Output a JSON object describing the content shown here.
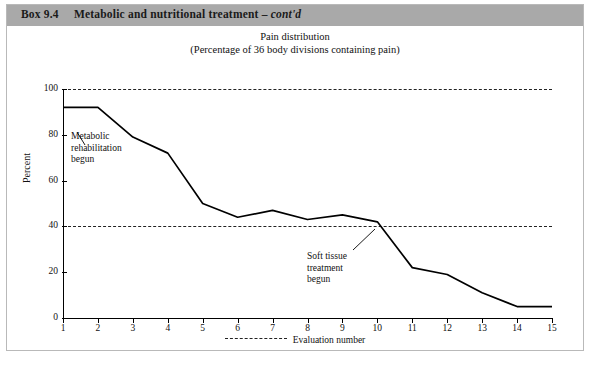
{
  "box": {
    "label": "Box 9.4",
    "title_plain": "Metabolic and nutritional treatment – ",
    "title_italic": "cont'd"
  },
  "annotations": [
    {
      "name": "metabolic-rehabilitation-annotation",
      "text": "Metabolic\nrehabilitation\nbegun"
    },
    {
      "name": "soft-tissue-treatment-annotation",
      "text": "Soft tissue\ntreatment\nbegun"
    }
  ],
  "chart_data": {
    "type": "line",
    "title": "Pain distribution",
    "subtitle": "(Percentage of 36 body divisions containing pain)",
    "xlabel": "Evaluation number",
    "ylabel": "Percent",
    "x": [
      1,
      2,
      3,
      4,
      5,
      6,
      7,
      8,
      9,
      10,
      11,
      12,
      13,
      14,
      15
    ],
    "categories": [
      "1",
      "2",
      "3",
      "4",
      "5",
      "6",
      "7",
      "8",
      "9",
      "10",
      "11",
      "12",
      "13",
      "14",
      "15"
    ],
    "values": [
      92,
      92,
      79,
      72,
      50,
      44,
      47,
      43,
      45,
      42,
      22,
      19,
      11,
      5,
      5
    ],
    "ylim": [
      0,
      100
    ],
    "yticks": [
      0,
      20,
      40,
      60,
      80,
      100
    ],
    "xlim": [
      1,
      15
    ],
    "grid": "horizontal-dashed",
    "gridlines_at": [
      40,
      100
    ],
    "legend": {
      "position": "bottom",
      "entries": [
        "Evaluation number"
      ],
      "style": "dashed"
    },
    "line_color": "#000000"
  }
}
